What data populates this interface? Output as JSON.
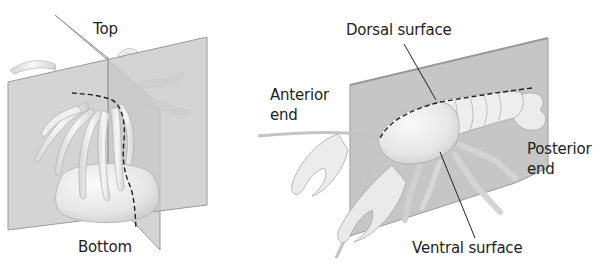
{
  "panels": [
    {
      "name": "sea-anemone",
      "labels": {
        "top": "Top",
        "bottom": "Bottom"
      }
    },
    {
      "name": "crayfish",
      "labels": {
        "dorsal": "Dorsal surface",
        "anterior_line1": "Anterior",
        "anterior_line2": "end",
        "posterior_line1": "Posterior",
        "posterior_line2": "end",
        "ventral": "Ventral surface"
      }
    }
  ],
  "colors": {
    "plane": "#c8c8c8",
    "plane_edge": "#9a9a9a",
    "body": "#ececec",
    "outline": "#a8a8a8",
    "dashed_line": "#222222",
    "text": "#1e1e1e"
  }
}
